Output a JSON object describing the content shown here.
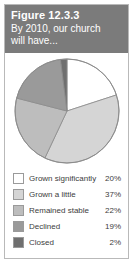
{
  "figure": {
    "number": "Figure 12.3.3",
    "subtitle_line_1": "By 2010, our church",
    "subtitle_line_2": "will have...",
    "header_bg": "#7b7b7b",
    "header_text_color": "#ffffff",
    "border_color": "#b9b9b9"
  },
  "chart_data": {
    "type": "pie",
    "title": "By 2010, our church will have...",
    "xlabel": "",
    "ylabel": "",
    "legend_position": "bottom",
    "start_angle_deg": 0,
    "direction": "clockwise",
    "categories": [
      "Grown significantly",
      "Grown a little",
      "Remained stable",
      "Declined",
      "Closed"
    ],
    "values": [
      20,
      37,
      22,
      19,
      2
    ],
    "value_labels": [
      "20%",
      "37%",
      "22%",
      "19%",
      "2%"
    ],
    "colors": [
      "#ffffff",
      "#d5d5d5",
      "#bdbdbd",
      "#9a9a9a",
      "#6f6f6f"
    ],
    "slice_border_color": "#8c8c8c"
  },
  "legend": {
    "rows": [
      {
        "label": "Grown significantly",
        "value": "20%",
        "color": "#ffffff"
      },
      {
        "label": "Grown a little",
        "value": "37%",
        "color": "#d5d5d5"
      },
      {
        "label": "Remained stable",
        "value": "22%",
        "color": "#bdbdbd"
      },
      {
        "label": "Declined",
        "value": "19%",
        "color": "#9a9a9a"
      },
      {
        "label": "Closed",
        "value": "2%",
        "color": "#6f6f6f"
      }
    ]
  }
}
